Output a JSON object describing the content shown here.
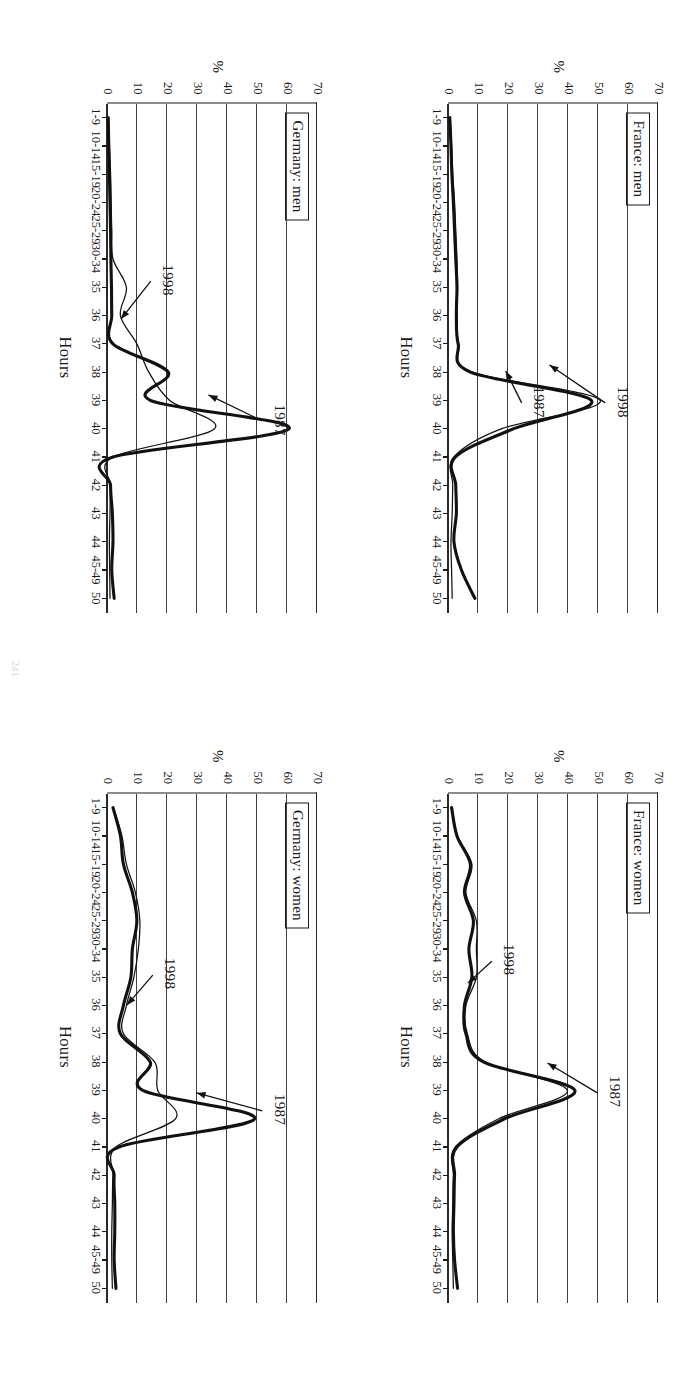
{
  "figure": {
    "orientation": "page rotated 90 degrees clockwise",
    "page_number": "241",
    "axis_x_label": "Hours",
    "axis_y_label": "%",
    "x_categories": [
      "1-9",
      "10-14",
      "15-19",
      "20-24",
      "25-29",
      "30-34",
      "35",
      "36",
      "37",
      "38",
      "39",
      "40",
      "41",
      "42",
      "43",
      "44",
      "45-49",
      "50"
    ],
    "y_ticks": [
      "0",
      "10",
      "20",
      "30",
      "40",
      "50",
      "60",
      "70"
    ],
    "series_names": [
      "1987",
      "1998"
    ]
  },
  "panels": [
    {
      "id": "france-men",
      "title": "France: men",
      "tags": [
        {
          "label": "1998",
          "x": 300,
          "y": 36
        },
        {
          "label": "1987",
          "x": 300,
          "y": 120
        }
      ]
    },
    {
      "id": "france-women",
      "title": "France: women",
      "tags": [
        {
          "label": "1987",
          "x": 300,
          "y": 44
        },
        {
          "label": "1998",
          "x": 168,
          "y": 150
        }
      ]
    },
    {
      "id": "germany-men",
      "title": "Germany: men",
      "tags": [
        {
          "label": "1987",
          "x": 318,
          "y": 38
        },
        {
          "label": "1998",
          "x": 178,
          "y": 150
        }
      ]
    },
    {
      "id": "germany-women",
      "title": "Germany: women",
      "tags": [
        {
          "label": "1987",
          "x": 318,
          "y": 38
        },
        {
          "label": "1998",
          "x": 182,
          "y": 148
        }
      ]
    }
  ],
  "chart_data": {
    "type": "line",
    "xlabel": "Hours",
    "ylabel": "%",
    "ylim": [
      0,
      70
    ],
    "ytick_step": 10,
    "grid": "horizontal gridlines at every 10% (drawn vertically on the rotated page)",
    "legend": "inline arrow annotations labelled 1987 and 1998",
    "categories": [
      "1-9",
      "10-14",
      "15-19",
      "20-24",
      "25-29",
      "30-34",
      "35",
      "36",
      "37",
      "38",
      "39",
      "40",
      "41",
      "42",
      "43",
      "44",
      "45-49",
      "50"
    ],
    "panels": [
      {
        "name": "France: men",
        "series": [
          {
            "name": "1987",
            "style": "thick",
            "values": [
              0.6,
              1.0,
              1.3,
              1.8,
              2.2,
              2.6,
              3.0,
              2.8,
              3.4,
              7.5,
              48.0,
              22.0,
              2.5,
              2.6,
              2.8,
              2.0,
              4.5,
              9.0
            ]
          },
          {
            "name": "1998",
            "style": "thin",
            "values": [
              0.7,
              1.2,
              1.6,
              2.2,
              2.6,
              3.0,
              3.2,
              3.0,
              3.6,
              8.0,
              51.0,
              18.0,
              2.0,
              1.6,
              1.4,
              1.0,
              1.2,
              1.4
            ]
          }
        ]
      },
      {
        "name": "France: women",
        "series": [
          {
            "name": "1987",
            "style": "thick",
            "values": [
              1.2,
              3.0,
              7.5,
              5.5,
              8.5,
              7.0,
              8.0,
              5.5,
              6.0,
              12.0,
              42.5,
              19.0,
              3.0,
              2.2,
              2.0,
              1.8,
              2.2,
              3.2
            ]
          },
          {
            "name": "1998",
            "style": "thin",
            "values": [
              1.4,
              3.2,
              8.0,
              6.0,
              9.5,
              9.5,
              9.5,
              6.0,
              6.5,
              12.5,
              40.0,
              17.0,
              2.4,
              1.8,
              1.6,
              1.4,
              1.6,
              1.8
            ]
          }
        ]
      },
      {
        "name": "Germany: men",
        "series": [
          {
            "name": "1987",
            "style": "thick",
            "values": [
              0.4,
              0.6,
              0.8,
              1.0,
              1.2,
              1.3,
              1.5,
              1.6,
              2.0,
              20.5,
              14.5,
              61.0,
              2.0,
              1.2,
              1.8,
              2.0,
              1.6,
              2.4
            ]
          },
          {
            "name": "1998",
            "style": "thin",
            "values": [
              0.5,
              0.8,
              1.2,
              1.4,
              1.6,
              2.0,
              6.5,
              4.5,
              10.0,
              14.0,
              21.0,
              36.0,
              2.0,
              1.2,
              1.0,
              0.8,
              0.9,
              1.0
            ]
          }
        ]
      },
      {
        "name": "Germany: women",
        "series": [
          {
            "name": "1987",
            "style": "thick",
            "values": [
              2.0,
              4.5,
              5.5,
              8.5,
              10.0,
              8.5,
              8.0,
              5.5,
              4.5,
              14.5,
              12.0,
              49.5,
              4.0,
              2.4,
              2.6,
              2.6,
              2.4,
              3.0
            ]
          },
          {
            "name": "1998",
            "style": "thin",
            "values": [
              2.2,
              5.0,
              6.5,
              9.5,
              11.0,
              10.5,
              9.0,
              6.5,
              5.5,
              16.0,
              17.0,
              23.0,
              3.0,
              2.0,
              1.8,
              1.6,
              1.6,
              1.8
            ]
          }
        ]
      }
    ]
  }
}
